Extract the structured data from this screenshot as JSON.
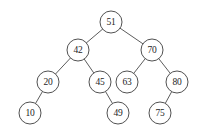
{
  "figure": {
    "background_color": "#ffffff",
    "node_fill_color": "#ffffff",
    "node_stroke_color": "#3d3d3d",
    "edge_color": "#4a4a4a",
    "label_color": "#1d1d1d",
    "node_radius": 11
  },
  "chart_data": {
    "type": "diagram",
    "diagram_kind": "binary-search-tree",
    "node_count": 10,
    "depth": 4,
    "root": "51",
    "nodes": [
      {
        "id": "n51",
        "label": "51",
        "x": 111,
        "y": 22,
        "level": 1
      },
      {
        "id": "n42",
        "label": "42",
        "x": 78,
        "y": 50,
        "level": 2
      },
      {
        "id": "n70",
        "label": "70",
        "x": 152,
        "y": 50,
        "level": 2
      },
      {
        "id": "n20",
        "label": "20",
        "x": 48,
        "y": 82,
        "level": 3
      },
      {
        "id": "n45",
        "label": "45",
        "x": 100,
        "y": 82,
        "level": 3
      },
      {
        "id": "n63",
        "label": "63",
        "x": 127,
        "y": 82,
        "level": 3
      },
      {
        "id": "n80",
        "label": "80",
        "x": 177,
        "y": 82,
        "level": 3
      },
      {
        "id": "n10",
        "label": "10",
        "x": 30,
        "y": 113,
        "level": 4
      },
      {
        "id": "n49",
        "label": "49",
        "x": 118,
        "y": 113,
        "level": 4
      },
      {
        "id": "n75",
        "label": "75",
        "x": 160,
        "y": 113,
        "level": 4
      }
    ],
    "edges": [
      {
        "from": "n51",
        "to": "n42",
        "side": "left"
      },
      {
        "from": "n51",
        "to": "n70",
        "side": "right"
      },
      {
        "from": "n42",
        "to": "n20",
        "side": "left"
      },
      {
        "from": "n42",
        "to": "n45",
        "side": "right"
      },
      {
        "from": "n70",
        "to": "n63",
        "side": "left"
      },
      {
        "from": "n70",
        "to": "n80",
        "side": "right"
      },
      {
        "from": "n20",
        "to": "n10",
        "side": "left"
      },
      {
        "from": "n45",
        "to": "n49",
        "side": "right"
      },
      {
        "from": "n80",
        "to": "n75",
        "side": "left"
      }
    ],
    "values_in_order": [
      "10",
      "20",
      "42",
      "45",
      "49",
      "51",
      "63",
      "70",
      "75",
      "80"
    ]
  }
}
